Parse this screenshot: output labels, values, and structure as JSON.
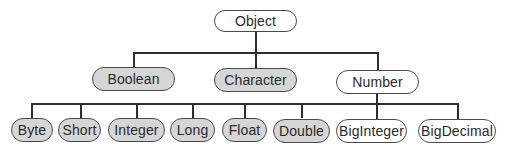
{
  "diagram": {
    "colors": {
      "filled_node": "#d6d6d6",
      "hollow_node": "#ffffff",
      "border": "#4a4a4a",
      "line": "#2e2e2e"
    },
    "root": {
      "label": "Object",
      "style": "hollow"
    },
    "level1": [
      {
        "label": "Boolean",
        "style": "filled"
      },
      {
        "label": "Character",
        "style": "filled"
      },
      {
        "label": "Number",
        "style": "hollow"
      }
    ],
    "level2": [
      {
        "label": "Byte",
        "style": "filled"
      },
      {
        "label": "Short",
        "style": "filled"
      },
      {
        "label": "Integer",
        "style": "filled"
      },
      {
        "label": "Long",
        "style": "filled"
      },
      {
        "label": "Float",
        "style": "filled"
      },
      {
        "label": "Double",
        "style": "filled"
      },
      {
        "label": "BigInteger",
        "style": "hollow"
      },
      {
        "label": "BigDecimal",
        "style": "hollow"
      }
    ],
    "edges": [
      [
        "Object",
        "Boolean"
      ],
      [
        "Object",
        "Character"
      ],
      [
        "Object",
        "Number"
      ],
      [
        "Number",
        "Byte"
      ],
      [
        "Number",
        "Short"
      ],
      [
        "Number",
        "Integer"
      ],
      [
        "Number",
        "Long"
      ],
      [
        "Number",
        "Float"
      ],
      [
        "Number",
        "Double"
      ],
      [
        "Number",
        "BigInteger"
      ],
      [
        "Number",
        "BigDecimal"
      ]
    ]
  }
}
